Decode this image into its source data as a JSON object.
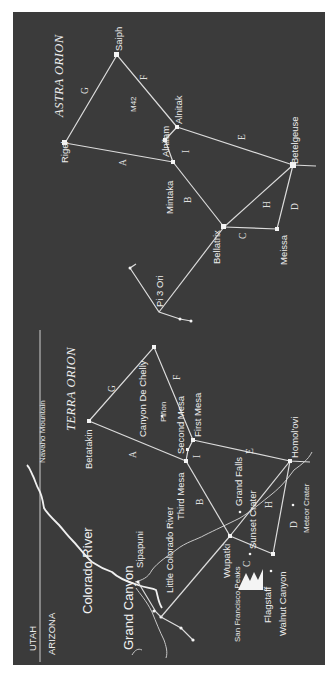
{
  "colors": {
    "background": "#3b3b3b",
    "ink": "#ececec",
    "page": "#ffffff"
  },
  "titles": {
    "astra": "ASTRA ORION",
    "terra": "TERRA ORION"
  },
  "astra": {
    "stars": {
      "saiph": "Saiph",
      "rigel": "Rigel",
      "m42": "M42",
      "alnilam": "Alnilam",
      "alnitak": "Alnitak",
      "mintaka": "Mintaka",
      "betelgeuse": "Betelgeuse",
      "bellatrix": "Bellatrix",
      "meissa": "Meissa",
      "pi3ori": "Pi 3 Ori"
    },
    "segments": {
      "A": "A",
      "B": "B",
      "C": "C",
      "D": "D",
      "E": "E",
      "F": "F",
      "G": "G",
      "H": "H",
      "I": "I"
    }
  },
  "terra": {
    "places": {
      "canyon_de_chelly": "Canyon De Chelly",
      "pinon": "Piñon",
      "betatakin": "Betatakin",
      "second_mesa": "Second Mesa",
      "first_mesa": "First Mesa",
      "third_mesa": "Third Mesa",
      "homolovi": "Homol'ovi",
      "grand_falls": "Grand Falls",
      "sunset_crater": "Sunset Crater",
      "meteor_crater": "Meteor Crater",
      "wupatki": "Wupatki",
      "san_francisco_peaks": "San Francisco Peaks",
      "flagstaff": "Flagstaff",
      "walnut_canyon": "Walnut Canyon",
      "navaho_mountain": "Navaho Mountain",
      "little_colorado_river": "Little Colorado River",
      "sipapuni": "Sipapuni",
      "colorado_river": "Colorado River",
      "grand_canyon": "Grand Canyon"
    },
    "segments": {
      "A": "A",
      "B": "B",
      "C": "C",
      "D": "D",
      "E": "E",
      "F": "F",
      "G": "G",
      "H": "H",
      "I": "I"
    }
  },
  "states": {
    "utah": "UTAH",
    "arizona": "ARIZONA"
  }
}
